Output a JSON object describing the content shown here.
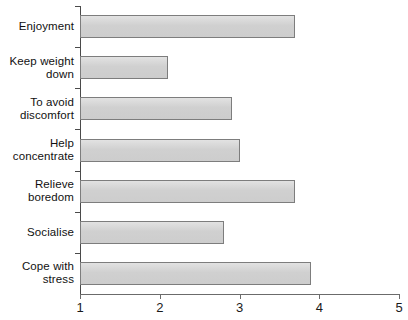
{
  "chart_data": {
    "type": "bar",
    "orientation": "horizontal",
    "title": "",
    "subtitle": "",
    "xlabel": "",
    "ylabel": "",
    "categories": [
      "Enjoyment",
      "Keep weight down",
      "To avoid discomfort",
      "Help concentrate",
      "Relieve boredom",
      "Socialise",
      "Cope with stress"
    ],
    "category_lines": [
      [
        "Enjoyment"
      ],
      [
        "Keep weight",
        "down"
      ],
      [
        "To avoid",
        "discomfort"
      ],
      [
        "Help",
        "concentrate"
      ],
      [
        "Relieve",
        "boredom"
      ],
      [
        "Socialise"
      ],
      [
        "Cope with",
        "stress"
      ]
    ],
    "values": [
      3.7,
      2.1,
      2.9,
      3.0,
      3.7,
      2.8,
      3.9
    ],
    "xlim": [
      1,
      5
    ],
    "xticks": [
      1,
      2,
      3,
      4,
      5
    ],
    "xtick_labels": [
      "1",
      "2",
      "3",
      "4",
      "5"
    ],
    "grid": false,
    "legend": false,
    "bar_color": "#d4d4d4",
    "bar_border_color": "#7d7d7d",
    "axis_color": "#4a4a4a",
    "text_color": "#111111",
    "background_color": "#ffffff"
  }
}
